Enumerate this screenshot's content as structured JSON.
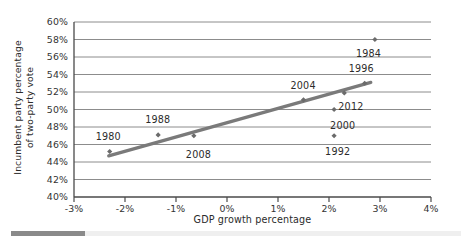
{
  "chart_data": {
    "type": "scatter",
    "title": "",
    "xlabel": "GDP growth percentage",
    "ylabel_line1": "Incumbent party percentage",
    "ylabel_line2": "of two-party vote",
    "xlim": [
      -3,
      4
    ],
    "ylim": [
      40,
      60
    ],
    "xticks": [
      "-3%",
      "-2%",
      "-1%",
      "0%",
      "1%",
      "2%",
      "3%",
      "4%"
    ],
    "xtick_values": [
      -3,
      -2,
      -1,
      0,
      1,
      2,
      3,
      4
    ],
    "yticks": [
      "40%",
      "42%",
      "44%",
      "46%",
      "48%",
      "50%",
      "52%",
      "54%",
      "56%",
      "58%",
      "60%"
    ],
    "ytick_values": [
      40,
      42,
      44,
      46,
      48,
      50,
      52,
      54,
      56,
      58,
      60
    ],
    "grid": "horizontal",
    "legend": "none",
    "points": [
      {
        "label": "1980",
        "x": -2.3,
        "y": 45.2,
        "label_dx": -3,
        "label_dy": -15
      },
      {
        "label": "1988",
        "x": -1.35,
        "y": 47.1,
        "label_dx": -2,
        "label_dy": -15
      },
      {
        "label": "2008",
        "x": -0.65,
        "y": 47.0,
        "label_dx": 3,
        "label_dy": 19
      },
      {
        "label": "2004",
        "x": 1.5,
        "y": 51.1,
        "label_dx": -2,
        "label_dy": -14
      },
      {
        "label": "2012",
        "x": 2.3,
        "y": 51.9,
        "label_dx": 5,
        "label_dy": 14
      },
      {
        "label": "1996",
        "x": 2.7,
        "y": 53.0,
        "label_dx": -5,
        "label_dy": -14
      },
      {
        "label": "1984",
        "x": 2.9,
        "y": 58.0,
        "label_dx": -8,
        "label_dy": 14
      },
      {
        "label": "2000",
        "x": 2.1,
        "y": 50.0,
        "label_dx": 7,
        "label_dy": 16
      },
      {
        "label": "1992",
        "x": 2.1,
        "y": 47.0,
        "label_dx": 2,
        "label_dy": 16
      }
    ],
    "trendline": {
      "x0": -2.32,
      "y0": 44.7,
      "x1": 2.82,
      "y1": 53.1
    },
    "colors": {
      "marker": "#6b6b6b",
      "trendline": "#7a7a7a",
      "gridline": "#8c8c8c",
      "axis": "#4a4a4a",
      "text": "#2b2b2b"
    }
  }
}
